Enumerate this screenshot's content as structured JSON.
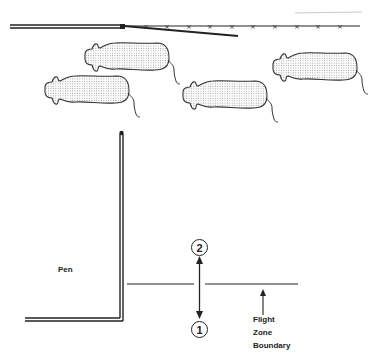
{
  "labels": {
    "pen": "Pen",
    "position_1": "1",
    "position_2": "2",
    "flight_zone_line1": "Flight",
    "flight_zone_line2": "Zone",
    "flight_zone_line3": "Boundary"
  },
  "elements": {
    "cattle_count": 4,
    "fence_post_markers": 10
  },
  "colors": {
    "line": "#222222",
    "cow_fill": "#e6e6e6",
    "background": "#ffffff"
  }
}
